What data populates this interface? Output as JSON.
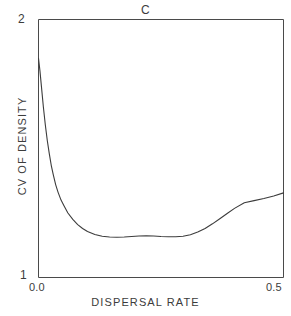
{
  "chart_data": {
    "type": "line",
    "title": "C",
    "xlabel": "DISPERSAL RATE",
    "ylabel": "CV OF DENSITY",
    "xlim": [
      0.0,
      0.5
    ],
    "ylim": [
      1,
      2
    ],
    "xticks": [
      0.0,
      0.5
    ],
    "xticklabels": [
      "0.0",
      "0.5"
    ],
    "yticks": [
      1,
      2
    ],
    "yticklabels": [
      "1",
      "2"
    ],
    "grid": false,
    "legend": null,
    "series": [
      {
        "name": "cv-of-density",
        "color": "#3c3c3c",
        "x": [
          0.0,
          0.003,
          0.006,
          0.01,
          0.014,
          0.018,
          0.022,
          0.026,
          0.03,
          0.035,
          0.04,
          0.046,
          0.052,
          0.06,
          0.07,
          0.08,
          0.09,
          0.1,
          0.115,
          0.13,
          0.145,
          0.16,
          0.175,
          0.19,
          0.205,
          0.22,
          0.235,
          0.25,
          0.265,
          0.28,
          0.295,
          0.31,
          0.325,
          0.34,
          0.355,
          0.37,
          0.385,
          0.4,
          0.42,
          0.44,
          0.46,
          0.48,
          0.5
        ],
        "y": [
          1.85,
          1.8,
          1.74,
          1.66,
          1.59,
          1.53,
          1.48,
          1.435,
          1.4,
          1.36,
          1.33,
          1.3,
          1.278,
          1.25,
          1.225,
          1.205,
          1.19,
          1.178,
          1.167,
          1.16,
          1.157,
          1.156,
          1.157,
          1.159,
          1.161,
          1.162,
          1.161,
          1.159,
          1.158,
          1.158,
          1.16,
          1.166,
          1.176,
          1.19,
          1.208,
          1.228,
          1.248,
          1.268,
          1.29,
          1.298,
          1.306,
          1.316,
          1.328
        ]
      }
    ]
  },
  "axes": {
    "title": "C",
    "ytick_top": "2",
    "ytick_bottom": "1",
    "xtick_left": "0.0",
    "xtick_right": "0.5",
    "ylabel": "CV OF DENSITY",
    "xlabel": "DISPERSAL RATE"
  },
  "style": {
    "axis_color": "#4a4a4a",
    "line_color": "#3c3c3c",
    "text_color": "#3c3c3c",
    "background": "#ffffff"
  }
}
